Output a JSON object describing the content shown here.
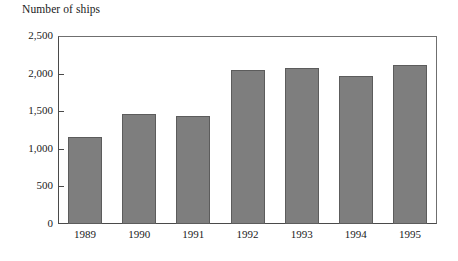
{
  "chart_data": {
    "type": "bar",
    "title": "Number of ships",
    "xlabel": "",
    "ylabel": "Number of ships",
    "categories": [
      "1989",
      "1990",
      "1991",
      "1992",
      "1993",
      "1994",
      "1995"
    ],
    "values": [
      1160,
      1460,
      1430,
      2050,
      2080,
      1970,
      2110
    ],
    "series": [
      {
        "name": "Number of ships",
        "values": [
          1160,
          1460,
          1430,
          2050,
          2080,
          1970,
          2110
        ]
      }
    ],
    "ylim": [
      0,
      2500
    ],
    "ytick_values": [
      0,
      500,
      1000,
      1500,
      2000,
      2500
    ],
    "ytick_labels": [
      "0",
      "500",
      "1,000",
      "1,500",
      "2,000",
      "2,500"
    ],
    "grid": false,
    "legend": "none",
    "bar_color": "#7e7e7e",
    "bar_edge_color": "#5c5c5c",
    "frame_color": "#4a4a4a",
    "background": "#ffffff"
  }
}
